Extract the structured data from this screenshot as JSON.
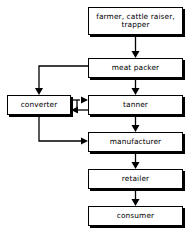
{
  "diagram": {
    "type": "flowchart",
    "background_color": "#ffffff",
    "line_color": "#000000",
    "node_fill_color": "#ffffff",
    "nodes": [
      {
        "id": "farmer",
        "label": "farmer, cattle raiser, trapper",
        "x": 88,
        "y": 7,
        "width": 95,
        "height": 28
      },
      {
        "id": "meat_packer",
        "label": "meat packer",
        "x": 88,
        "y": 58,
        "width": 95,
        "height": 20
      },
      {
        "id": "converter",
        "label": "converter",
        "x": 7,
        "y": 95,
        "width": 64,
        "height": 20
      },
      {
        "id": "tanner",
        "label": "tanner",
        "x": 88,
        "y": 95,
        "width": 95,
        "height": 20
      },
      {
        "id": "manufacturer",
        "label": "manufacturer",
        "x": 88,
        "y": 132,
        "width": 95,
        "height": 20
      },
      {
        "id": "retailer",
        "label": "retailer",
        "x": 88,
        "y": 169,
        "width": 95,
        "height": 20
      },
      {
        "id": "consumer",
        "label": "consumer",
        "x": 88,
        "y": 206,
        "width": 95,
        "height": 20
      }
    ],
    "edges": [
      {
        "id": "farmer-to-meat-packer",
        "from": "farmer",
        "to": "meat_packer",
        "arrowhead": "single"
      },
      {
        "id": "meat-packer-to-converter",
        "from": "meat_packer",
        "to": "converter",
        "arrowhead": "single"
      },
      {
        "id": "meat-packer-to-tanner",
        "from": "meat_packer",
        "to": "tanner",
        "arrowhead": "single"
      },
      {
        "id": "converter-to-tanner",
        "from": "converter",
        "to": "tanner",
        "arrowhead": "single"
      },
      {
        "id": "tanner-to-converter",
        "from": "tanner",
        "to": "converter",
        "arrowhead": "single"
      },
      {
        "id": "converter-to-manufacturer",
        "from": "converter",
        "to": "manufacturer",
        "arrowhead": "single"
      },
      {
        "id": "tanner-to-manufacturer",
        "from": "tanner",
        "to": "manufacturer",
        "arrowhead": "single"
      },
      {
        "id": "manufacturer-to-retailer",
        "from": "manufacturer",
        "to": "retailer",
        "arrowhead": "single"
      },
      {
        "id": "retailer-to-consumer",
        "from": "retailer",
        "to": "consumer",
        "arrowhead": "single"
      }
    ]
  }
}
